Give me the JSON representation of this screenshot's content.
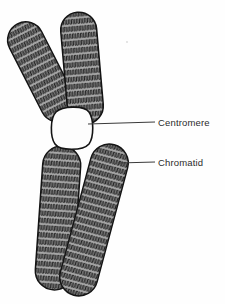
{
  "figure": {
    "background_color": "#fefefe",
    "ink_color": "#1a1a1a",
    "arm_fill_color": "#a8a8a8",
    "centromere_fill_color": "#fdfdfd",
    "label_color": "#2b2b2b",
    "leader_line_color": "#3a3a3a"
  },
  "labels": {
    "centromere": "Centromere",
    "chromatid": "Chromatid"
  },
  "parts": {
    "centromere": {
      "name": "centromere",
      "shape": "rounded-blob",
      "fill": "white",
      "center_x": 72,
      "center_y": 128
    },
    "arms": [
      {
        "name": "upper-left-chromatid-arm",
        "tilt_deg": -27,
        "length": 108,
        "width": 34
      },
      {
        "name": "upper-right-chromatid-arm",
        "tilt_deg": -5,
        "length": 112,
        "width": 34
      },
      {
        "name": "lower-left-chromatid-arm",
        "tilt_deg": 4,
        "length": 140,
        "width": 36
      },
      {
        "name": "lower-right-chromatid-arm",
        "tilt_deg": 15,
        "length": 150,
        "width": 36
      }
    ]
  },
  "leader_lines": {
    "centromere": {
      "x1": 88,
      "y1": 124,
      "x2": 155,
      "y2": 122
    },
    "chromatid": {
      "x1": 118,
      "y1": 163,
      "x2": 155,
      "y2": 162
    }
  }
}
